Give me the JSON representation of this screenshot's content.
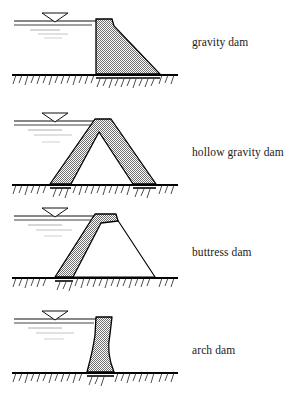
{
  "figure": {
    "background_color": "#ffffff",
    "line_color": "#000000",
    "fill_pattern": "stipple-checkerboard",
    "fill_color": "#b0b0b0",
    "width": 295,
    "height": 405
  },
  "panels": [
    {
      "label": "gravity dam",
      "dam_type": "gravity",
      "description": "Solid triangular concrete section with vertical upstream face and sloping downstream face",
      "ground_y": 75,
      "water_level_y": 20,
      "crest_x": 96,
      "crest_y": 20,
      "toe_x": 160,
      "profile": "M 96 19 L 112 19 L 114 26 L 160 74 L 96 74 Z",
      "water_lines": [
        {
          "x1": 14,
          "x2": 96,
          "y": 21,
          "weight": "solid"
        },
        {
          "x1": 14,
          "x2": 92,
          "y": 25,
          "weight": "solid"
        },
        {
          "x1": 30,
          "x2": 60,
          "y": 30,
          "weight": "light"
        },
        {
          "x1": 38,
          "x2": 68,
          "y": 34,
          "weight": "light"
        },
        {
          "x1": 44,
          "x2": 62,
          "y": 38,
          "weight": "light"
        }
      ],
      "wl_symbol_x": 55,
      "wl_symbol_y": 15
    },
    {
      "label": "hollow gravity dam",
      "dam_type": "hollow-gravity",
      "description": "A-frame triangular shell with hollow interior and uniform wall thickness",
      "ground_y": 185,
      "water_level_y": 120,
      "crest_x": 98,
      "crest_y": 120,
      "toe_x": 155,
      "outer_profile": "M 96 119 L 110 119 L 155 184 L 134 184 L 98 131 L 72 184 L 52 184 Z",
      "water_lines": [
        {
          "x1": 14,
          "x2": 96,
          "y": 121,
          "weight": "solid"
        },
        {
          "x1": 14,
          "x2": 92,
          "y": 125,
          "weight": "solid"
        },
        {
          "x1": 28,
          "x2": 62,
          "y": 130,
          "weight": "light"
        },
        {
          "x1": 34,
          "x2": 72,
          "y": 135,
          "weight": "light"
        },
        {
          "x1": 42,
          "x2": 60,
          "y": 142,
          "weight": "light"
        }
      ],
      "wl_symbol_x": 55,
      "wl_symbol_y": 115
    },
    {
      "label": "buttress dam",
      "dam_type": "buttress",
      "description": "Thick inclined upstream deck slab supported by thin outlined buttress",
      "ground_y": 278,
      "water_level_y": 215,
      "crest_x": 100,
      "crest_y": 215,
      "toe_x": 155,
      "slab_profile": "M 96 214 L 115 214 L 117 220 L 101 222 L 73 277 L 56 277 Z",
      "buttress_outline": "M 115 217 L 155 277 L 73 277",
      "water_lines": [
        {
          "x1": 14,
          "x2": 96,
          "y": 216,
          "weight": "solid"
        },
        {
          "x1": 14,
          "x2": 92,
          "y": 220,
          "weight": "solid"
        },
        {
          "x1": 28,
          "x2": 62,
          "y": 225,
          "weight": "light"
        },
        {
          "x1": 36,
          "x2": 72,
          "y": 230,
          "weight": "light"
        },
        {
          "x1": 44,
          "x2": 62,
          "y": 236,
          "weight": "light"
        }
      ],
      "wl_symbol_x": 55,
      "wl_symbol_y": 210
    },
    {
      "label": "arch dam",
      "dam_type": "arch",
      "description": "Slender curved section, concave upstream, widening toward the base",
      "ground_y": 373,
      "water_level_y": 318,
      "crest_x": 100,
      "crest_y": 318,
      "profile": "M 97 317 L 111 317 L 110 332 Q 107 352 112 372 L 88 372 Q 93 350 95 334 Z",
      "water_lines": [
        {
          "x1": 14,
          "x2": 97,
          "y": 319,
          "weight": "solid"
        },
        {
          "x1": 14,
          "x2": 94,
          "y": 323,
          "weight": "solid"
        },
        {
          "x1": 28,
          "x2": 62,
          "y": 328,
          "weight": "light"
        },
        {
          "x1": 36,
          "x2": 74,
          "y": 333,
          "weight": "light"
        },
        {
          "x1": 44,
          "x2": 64,
          "y": 339,
          "weight": "light"
        }
      ],
      "wl_symbol_x": 55,
      "wl_symbol_y": 313
    }
  ],
  "ground": {
    "x_start": 12,
    "x_end": 178,
    "line_weight": 2.2,
    "hatch_count": 26,
    "hatch_length": 9,
    "hatch_angle_deg": 70
  },
  "water_level_symbol": {
    "shape": "inverted-triangle",
    "width": 26,
    "height": 9
  }
}
